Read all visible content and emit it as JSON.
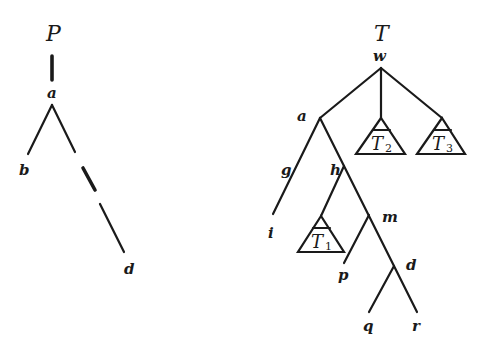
{
  "pattern_tree": {
    "title": "P",
    "nodes": {
      "root": "a",
      "left_child": "b",
      "right_descendant": "d"
    },
    "edges": [
      {
        "from": "P",
        "to": "a",
        "style": "thick"
      },
      {
        "from": "a",
        "to": "b",
        "style": "solid"
      },
      {
        "from": "a",
        "to": "d",
        "style": "dashed"
      }
    ]
  },
  "target_tree": {
    "title": "T",
    "nodes": {
      "root": "w",
      "a": "a",
      "g": "g",
      "i": "i",
      "h": "h",
      "m": "m",
      "p": "p",
      "d": "d",
      "q": "q",
      "r": "r"
    },
    "subtrees": [
      {
        "name": "T",
        "sub": "1"
      },
      {
        "name": "T",
        "sub": "2"
      },
      {
        "name": "T",
        "sub": "3"
      }
    ],
    "edges": [
      {
        "from": "w",
        "to": "a"
      },
      {
        "from": "w",
        "to": "T2"
      },
      {
        "from": "w",
        "to": "T3"
      },
      {
        "from": "a",
        "to": "i",
        "label": "g"
      },
      {
        "from": "a",
        "to": "h"
      },
      {
        "from": "h",
        "to": "T1"
      },
      {
        "from": "h",
        "to": "m"
      },
      {
        "from": "m",
        "to": "p"
      },
      {
        "from": "m",
        "to": "d"
      },
      {
        "from": "d",
        "to": "q"
      },
      {
        "from": "d",
        "to": "r"
      }
    ]
  }
}
